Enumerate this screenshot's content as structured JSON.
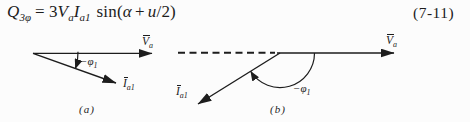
{
  "colors": {
    "ink": "#1d1d1d",
    "background": "#fcfcfc"
  },
  "equation": {
    "number": "(7-11)",
    "lhs_base": "Q",
    "lhs_sub": "3φ",
    "equals_sign": "=",
    "coefficient": "3",
    "voltage_base": "V",
    "voltage_sub": "a",
    "current_base": "I",
    "current_sub": "a1",
    "function_name": "sin(",
    "alpha": "α",
    "plus_sign": "+",
    "commutation_var": "u",
    "close_fraction": "/2)"
  },
  "diagram_a": {
    "caption": "(a)",
    "voltage_vector": {
      "base": "V",
      "sub": "a"
    },
    "current_vector": {
      "base": "I",
      "sub": "a1"
    },
    "angle": {
      "prefix": "−",
      "base": "φ",
      "sub": "1"
    }
  },
  "diagram_b": {
    "caption": "(b)",
    "voltage_vector": {
      "base": "V",
      "sub": "a"
    },
    "current_vector": {
      "base": "I",
      "sub": "a1"
    },
    "angle": {
      "prefix": "−",
      "base": "φ",
      "sub": "1"
    }
  }
}
